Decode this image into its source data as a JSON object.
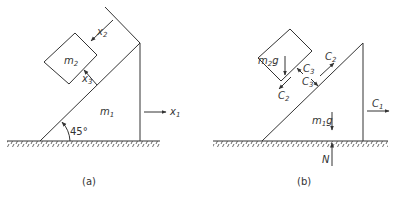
{
  "figure_a": {
    "caption": "(a)",
    "block_top_label": "m",
    "block_top_sub": "2",
    "wedge_label": "m",
    "wedge_sub": "1",
    "angle_label": "45°",
    "x1_label": "x",
    "x1_sub": "1",
    "x2_label": "x",
    "x2_sub": "2",
    "x3_label": "x",
    "x3_sub": "3"
  },
  "figure_b": {
    "caption": "(b)",
    "block_weight_label": "m",
    "block_weight_sub": "2",
    "block_weight_suffix": "g",
    "wedge_weight_label": "m",
    "wedge_weight_sub": "1",
    "wedge_weight_suffix": "g",
    "c1_label": "C",
    "c1_sub": "1",
    "c2_block_label": "C",
    "c2_block_sub": "2",
    "c2_wedge_label": "C",
    "c2_wedge_sub": "2",
    "c3_block_label": "C",
    "c3_block_sub": "3",
    "c3_wedge_label": "C",
    "c3_wedge_sub": "3",
    "normal_label": "N"
  },
  "colors": {
    "ink": "#333333",
    "background": "#ffffff"
  }
}
